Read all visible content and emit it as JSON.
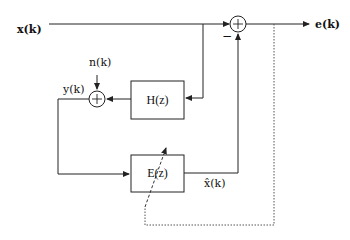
{
  "diagram": {
    "type": "block-diagram",
    "signals": {
      "input": "x(k)",
      "output": "e(k)",
      "noise": "n(k)",
      "observed": "y(k)",
      "estimate": "x̂(k)"
    },
    "blocks": [
      {
        "id": "H",
        "label": "H(z)"
      },
      {
        "id": "E",
        "label": "E(z)"
      }
    ],
    "junctions": [
      {
        "id": "sum-top",
        "symbol": "+",
        "minus_label": "−"
      },
      {
        "id": "sum-left",
        "symbol": "+"
      }
    ],
    "colors": {
      "line": "#222222",
      "dotted": "#555555",
      "background": "#ffffff"
    }
  }
}
